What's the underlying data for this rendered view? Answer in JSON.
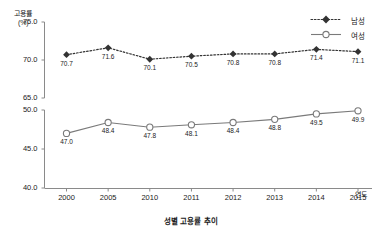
{
  "chart_data": {
    "type": "line",
    "title": "성별 고용률 추이",
    "xlabel": "연도",
    "ylabel": "고용률 (%)",
    "ylabel_line1": "고용률",
    "ylabel_line2": "(%)",
    "categories": [
      "2000",
      "2005",
      "2010",
      "2011",
      "2012",
      "2013",
      "2014",
      "2015"
    ],
    "broken_axis": true,
    "upper_panel": {
      "ylim": [
        65.0,
        75.0
      ],
      "yticks": [
        "75.0",
        "70.0",
        "65.0"
      ],
      "ytick_values": [
        75.0,
        70.0,
        65.0
      ]
    },
    "lower_panel": {
      "ylim": [
        40.0,
        50.0
      ],
      "yticks": [
        "50.0",
        "45.0",
        "40.0"
      ],
      "ytick_values": [
        50.0,
        45.0,
        40.0
      ]
    },
    "grid": false,
    "legend_position": "top-right",
    "series": [
      {
        "name": "남성",
        "panel": "upper",
        "marker": "filled-diamond",
        "line_style": "dotted",
        "color": "#333333",
        "values": [
          70.7,
          71.6,
          70.1,
          70.5,
          70.8,
          70.8,
          71.4,
          71.1
        ],
        "labels": [
          "70.7",
          "71.6",
          "70.1",
          "70.5",
          "70.8",
          "70.8",
          "71.4",
          "71.1"
        ],
        "label_position": [
          "below",
          "below",
          "below",
          "below",
          "below",
          "below",
          "below",
          "below"
        ]
      },
      {
        "name": "여성",
        "panel": "lower",
        "marker": "open-circle",
        "line_style": "solid",
        "color": "#7a7a7a",
        "values": [
          47.0,
          48.4,
          47.8,
          48.1,
          48.4,
          48.8,
          49.5,
          49.9
        ],
        "labels": [
          "47.0",
          "48.4",
          "47.8",
          "48.1",
          "48.4",
          "48.8",
          "49.5",
          "49.9"
        ],
        "label_position": [
          "below",
          "below",
          "below",
          "below",
          "below",
          "below",
          "below",
          "below"
        ]
      }
    ]
  },
  "legend": {
    "male_label": "남성",
    "female_label": "여성"
  },
  "colors": {
    "male": "#333333",
    "female": "#7a7a7a",
    "axis": "#8a8a8a",
    "text": "#1a1a1a"
  }
}
